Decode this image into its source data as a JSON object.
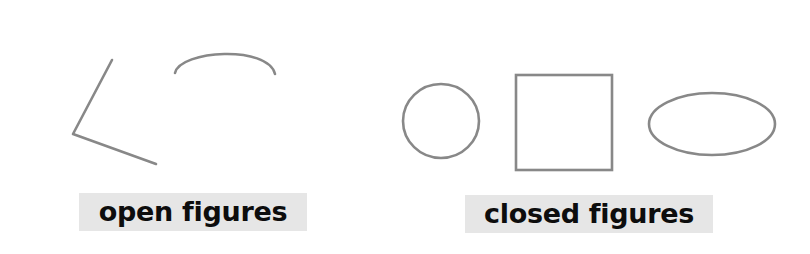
{
  "colors": {
    "stroke": "#888888",
    "label_bg": "#e6e6e6",
    "label_text": "#0d0d0d"
  },
  "groups": [
    {
      "label": "open figures",
      "shapes": [
        "angle (two connected line segments)",
        "open arc"
      ]
    },
    {
      "label": "closed figures",
      "shapes": [
        "circle",
        "square",
        "ellipse"
      ]
    }
  ]
}
